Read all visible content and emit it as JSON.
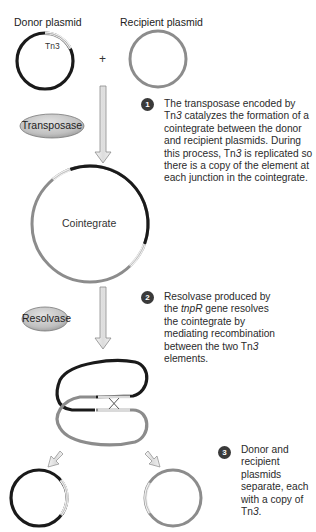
{
  "labels": {
    "donor_plasmid": "Donor plasmid",
    "recipient_plasmid": "Recipient plasmid",
    "tn3": "Tn3",
    "plus": "+",
    "cointegrate": "Cointegrate"
  },
  "enzymes": {
    "transposase": "Transposase",
    "resolvase": "Resolvase"
  },
  "steps": [
    {
      "number": "1",
      "text_parts": [
        {
          "t": "The transposase encoded by Tn",
          "i": false
        },
        {
          "t": "3",
          "i": true
        },
        {
          "t": " catalyzes the formation of a cointegrate between the donor and recipient plasmids. During this process, Tn",
          "i": false
        },
        {
          "t": "3",
          "i": true
        },
        {
          "t": " is replicated so there is a copy of the element at each junction in the cointegrate.",
          "i": false
        }
      ]
    },
    {
      "number": "2",
      "text_parts": [
        {
          "t": "Resolvase produced by the ",
          "i": false
        },
        {
          "t": "tnpR",
          "i": true
        },
        {
          "t": " gene resolves the cointegrate by mediating recombination between the two Tn",
          "i": false
        },
        {
          "t": "3",
          "i": true
        },
        {
          "t": " elements.",
          "i": false
        }
      ]
    },
    {
      "number": "3",
      "text_parts": [
        {
          "t": "Donor and recipient plasmids separate, each with a copy of Tn",
          "i": false
        },
        {
          "t": "3",
          "i": true
        },
        {
          "t": ".",
          "i": false
        }
      ]
    }
  ],
  "colors": {
    "donor_dna": "#1a1a1a",
    "recipient_dna": "#8c8c8c",
    "tn3_element": "#d6d6d6",
    "arrow_fill": "#e4e4e4",
    "arrow_stroke": "#8a8a8a",
    "enzyme_fill": "#c4c4c4",
    "badge": "#3a3a3a"
  }
}
